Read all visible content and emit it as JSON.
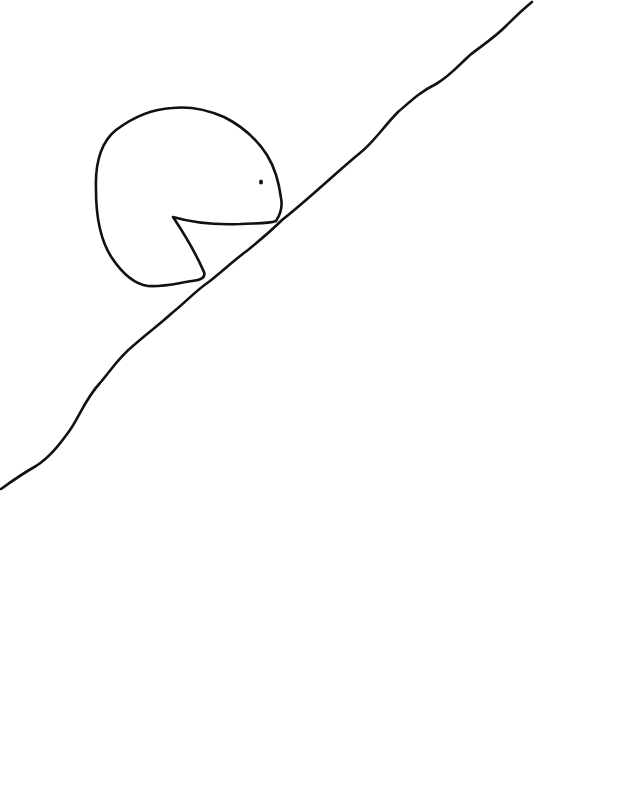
{
  "drawing": {
    "background": "#ffffff",
    "stroke_color": "#111111",
    "elements": [
      {
        "name": "slope-line",
        "description": "hand-drawn diagonal line rising from lower-left to upper-right"
      },
      {
        "name": "creature",
        "description": "round pac-man-like creature with an open mouth resting on the slope"
      },
      {
        "name": "creature-eye",
        "description": "small dot eye"
      }
    ]
  }
}
